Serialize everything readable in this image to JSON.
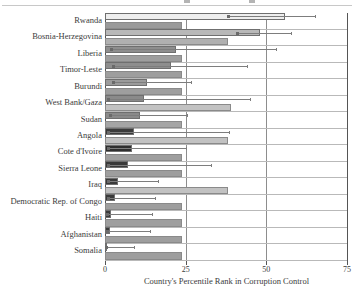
{
  "chart_data": {
    "type": "bar",
    "orientation": "horizontal",
    "title": "",
    "xlabel": "Country's Percentile Rank in Corruption Control",
    "ylabel": "",
    "xlim": [
      0,
      75
    ],
    "xticks": [
      0,
      25,
      50,
      75
    ],
    "xtick_labels": [
      "0",
      "25",
      "50",
      "75"
    ],
    "grid": false,
    "reference_lines": [
      25,
      50
    ],
    "legend": "none",
    "categories": [
      "Rwanda",
      "Bosnia-Herzegovina",
      "Liberia",
      "Timor-Leste",
      "Burundi",
      "West Bank/Gaza",
      "Sudan",
      "Angola",
      "Cote d'Ivoire",
      "Sierra Leone",
      "Iraq",
      "Democratic Rep. of Congo",
      "Haiti",
      "Afghanistan",
      "Somalia"
    ],
    "series": [
      {
        "name": "Country percentile rank",
        "values": [
          55.7,
          48.0,
          22.0,
          20.5,
          13.0,
          12.0,
          11.0,
          9.0,
          8.5,
          7.0,
          4.0,
          3.0,
          2.0,
          1.5,
          0.3
        ],
        "errors_low": [
          38.0,
          41.0,
          2.0,
          2.5,
          2.5,
          1.0,
          1.5,
          1.0,
          1.0,
          1.0,
          0.8,
          0.8,
          0.6,
          0.5,
          0.2
        ],
        "errors_high": [
          65.0,
          57.5,
          53.0,
          44.0,
          26.5,
          45.0,
          25.5,
          38.5,
          25.0,
          33.0,
          16.5,
          15.5,
          14.5,
          14.0,
          9.0
        ]
      },
      {
        "name": "Comparison group average",
        "values": [
          24.0,
          38.0,
          24.0,
          24.0,
          24.0,
          39.0,
          24.0,
          38.0,
          24.0,
          24.0,
          38.0,
          24.0,
          24.0,
          24.0,
          24.0
        ]
      }
    ],
    "colors": {
      "bar_upper_light": "#eeeeee",
      "bar_upper_mid": "#b5b5b5",
      "bar_upper_dark": "#3a3a3a",
      "bar_lower_light": "#c3c3c3",
      "bar_lower_mid": "#9a9a9a",
      "error_bar": "#7d7d7d",
      "axis": "#555555",
      "reference_line": "#8d8d8d",
      "text": "#3b3b3b"
    },
    "bar_fills_upper": [
      "#eeeeee",
      "#b8b8b8",
      "#8e8e8e",
      "#8e8e8e",
      "#9b9b9b",
      "#8a8a8a",
      "#8a8a8a",
      "#3a3a3a",
      "#2f2f2f",
      "#3a3a3a",
      "#3a3a3a",
      "#3a3a3a",
      "#3a3a3a",
      "#3a3a3a",
      "#3a3a3a"
    ],
    "bar_fills_lower": [
      "#9a9a9a",
      "#b0b0b0",
      "#9e9e9e",
      "#9e9e9e",
      "#9e9e9e",
      "#c2c2c2",
      "#a5a5a5",
      "#c2c2c2",
      "#9e9e9e",
      "#9e9e9e",
      "#c2c2c2",
      "#9e9e9e",
      "#9e9e9e",
      "#9e9e9e",
      "#9e9e9e"
    ]
  }
}
